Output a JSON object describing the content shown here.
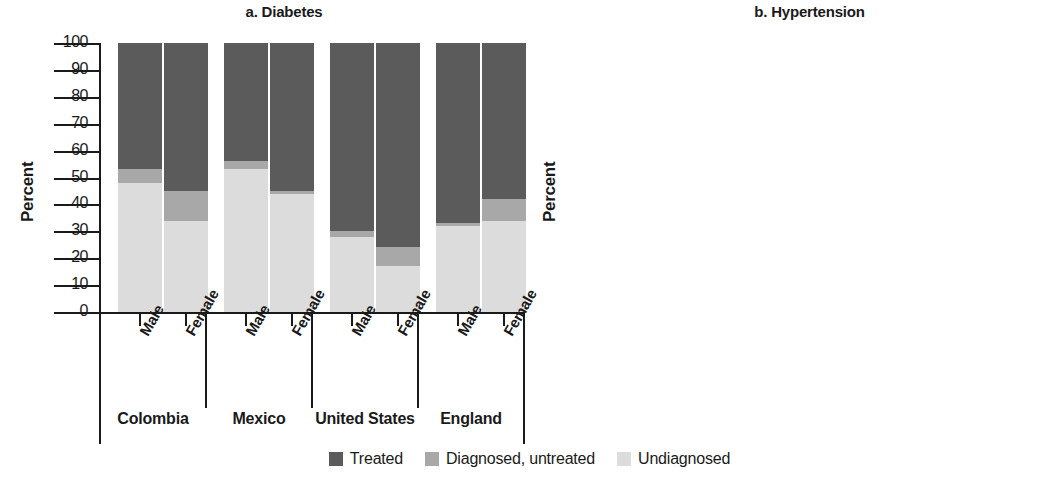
{
  "figure": {
    "ylabel": "Percent",
    "yticks": [
      0,
      10,
      20,
      30,
      40,
      50,
      60,
      70,
      80,
      90,
      100
    ],
    "sex_labels": [
      "Male",
      "Female"
    ],
    "countries": [
      "Colombia",
      "Mexico",
      "United States",
      "England"
    ]
  },
  "legend": {
    "items": [
      {
        "label": "Treated",
        "color": "#5b5b5b"
      },
      {
        "label": "Diagnosed, untreated",
        "color": "#a8a8a8"
      },
      {
        "label": "Undiagnosed",
        "color": "#dcdcdc"
      }
    ]
  },
  "colors": {
    "treated": "#5b5b5b",
    "diagnosed_untreated": "#a8a8a8",
    "undiagnosed": "#dcdcdc",
    "axis": "#1a1a1a",
    "background": "#ffffff"
  },
  "chart_data": [
    {
      "type": "bar",
      "stacked": true,
      "panel": "a",
      "title": "a. Diabetes",
      "xlabel": "",
      "ylabel": "Percent",
      "ylim": [
        0,
        100
      ],
      "yticks": [
        0,
        10,
        20,
        30,
        40,
        50,
        60,
        70,
        80,
        90,
        100
      ],
      "grid": false,
      "legend_position": "bottom",
      "categories": [
        "Colombia Male",
        "Colombia Female",
        "Mexico Male",
        "Mexico Female",
        "United States Male",
        "United States Female",
        "England Male",
        "England Female"
      ],
      "series": [
        {
          "name": "Undiagnosed",
          "values": [
            48,
            34,
            53,
            44,
            28,
            17,
            32,
            34
          ]
        },
        {
          "name": "Diagnosed, untreated",
          "values": [
            5,
            11,
            3,
            1,
            2,
            7,
            1,
            8
          ]
        },
        {
          "name": "Treated",
          "values": [
            47,
            55,
            44,
            55,
            70,
            76,
            67,
            58
          ]
        }
      ],
      "cumulative_tops": {
        "undiagnosed": [
          48,
          34,
          53,
          44,
          28,
          17,
          32,
          34
        ],
        "diagnosed_untreated": [
          53,
          45,
          56,
          45,
          30,
          24,
          33,
          42
        ],
        "treated": [
          100,
          100,
          100,
          100,
          100,
          100,
          100,
          100
        ]
      }
    },
    {
      "type": "bar",
      "stacked": true,
      "panel": "b",
      "title": "b. Hypertension",
      "xlabel": "",
      "ylabel": "Percent",
      "ylim": [
        0,
        100
      ],
      "yticks": [
        0,
        10,
        20,
        30,
        40,
        50,
        60,
        70,
        80,
        90,
        100
      ],
      "grid": false,
      "legend_position": "bottom",
      "categories": [
        "Colombia Male",
        "Colombia Female",
        "Mexico Male",
        "Mexico Female",
        "United States Male",
        "United States Female",
        "England Male",
        "England Female"
      ],
      "series": [
        {
          "name": "Undiagnosed",
          "values": [
            63,
            42,
            58,
            43,
            24,
            13,
            30,
            27
          ]
        },
        {
          "name": "Diagnosed, untreated",
          "values": [
            7,
            5,
            11,
            13,
            3,
            6,
            10,
            16
          ]
        },
        {
          "name": "Treated",
          "values": [
            30,
            53,
            31,
            44,
            73,
            81,
            60,
            57
          ]
        }
      ],
      "cumulative_tops": {
        "undiagnosed": [
          63,
          42,
          58,
          43,
          24,
          13,
          30,
          27
        ],
        "diagnosed_untreated": [
          70,
          47,
          69,
          56,
          27,
          19,
          40,
          43
        ],
        "treated": [
          100,
          100,
          100,
          100,
          100,
          100,
          100,
          100
        ]
      }
    }
  ]
}
